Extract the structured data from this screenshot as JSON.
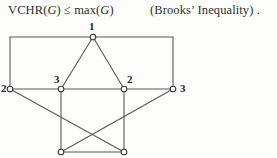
{
  "formula": {
    "lhs": "VCHR(",
    "lhs_var": "G",
    "lhs_close": ")",
    "relation": "≤",
    "rhs": "max(",
    "rhs_var": "G",
    "rhs_close": ")",
    "full_text": "VCHR(G) ≤ max(G)",
    "note": "(Brooks’ Inequality) ."
  },
  "graph": {
    "caption": "graph-with-vertex-colouring",
    "stroke_color": "#595959",
    "vertex_fill": "#ffffff",
    "vertex_stroke": "#3a3a3a",
    "vertices": [
      {
        "id": "v-top",
        "x": 93,
        "y": 19,
        "label": "1",
        "label_x": 89,
        "label_y": 3
      },
      {
        "id": "v-left",
        "x": 10,
        "y": 71,
        "label": "2",
        "label_x": 1,
        "label_y": 65
      },
      {
        "id": "v-mid-left",
        "x": 61,
        "y": 71,
        "label": "3",
        "label_x": 54,
        "label_y": 56
      },
      {
        "id": "v-mid-right",
        "x": 124,
        "y": 71,
        "label": "2",
        "label_x": 127,
        "label_y": 56
      },
      {
        "id": "v-right",
        "x": 173,
        "y": 71,
        "label": "3",
        "label_x": 180,
        "label_y": 65
      },
      {
        "id": "v-bottom-left",
        "x": 61,
        "y": 134,
        "label": "",
        "label_x": 0,
        "label_y": 0
      },
      {
        "id": "v-bottom-right",
        "x": 124,
        "y": 134,
        "label": "",
        "label_x": 0,
        "label_y": 0
      }
    ],
    "corners": [
      {
        "id": "c-top-left",
        "x": 10,
        "y": 19
      },
      {
        "id": "c-top-right",
        "x": 173,
        "y": 19
      }
    ],
    "edges": [
      {
        "from": "v-left",
        "to": "c-top-left",
        "x1": 10,
        "y1": 71,
        "x2": 10,
        "y2": 19
      },
      {
        "from": "c-top-left",
        "to": "v-top",
        "x1": 10,
        "y1": 19,
        "x2": 93,
        "y2": 19
      },
      {
        "from": "v-top",
        "to": "c-top-right",
        "x1": 93,
        "y1": 19,
        "x2": 173,
        "y2": 19
      },
      {
        "from": "c-top-right",
        "to": "v-right",
        "x1": 173,
        "y1": 19,
        "x2": 173,
        "y2": 71
      },
      {
        "from": "v-top",
        "to": "v-mid-left",
        "x1": 93,
        "y1": 19,
        "x2": 61,
        "y2": 71
      },
      {
        "from": "v-top",
        "to": "v-mid-right",
        "x1": 93,
        "y1": 19,
        "x2": 124,
        "y2": 71
      },
      {
        "from": "v-left",
        "to": "v-mid-left",
        "x1": 10,
        "y1": 71,
        "x2": 61,
        "y2": 71
      },
      {
        "from": "v-mid-left",
        "to": "v-mid-right",
        "x1": 61,
        "y1": 71,
        "x2": 124,
        "y2": 71
      },
      {
        "from": "v-mid-right",
        "to": "v-right",
        "x1": 124,
        "y1": 71,
        "x2": 173,
        "y2": 71
      },
      {
        "from": "v-mid-left",
        "to": "v-bottom-left",
        "x1": 61,
        "y1": 71,
        "x2": 61,
        "y2": 134
      },
      {
        "from": "v-mid-right",
        "to": "v-bottom-right",
        "x1": 124,
        "y1": 71,
        "x2": 124,
        "y2": 134
      },
      {
        "from": "v-left",
        "to": "v-bottom-right",
        "x1": 10,
        "y1": 71,
        "x2": 124,
        "y2": 134
      },
      {
        "from": "v-right",
        "to": "v-bottom-left",
        "x1": 173,
        "y1": 71,
        "x2": 61,
        "y2": 134
      },
      {
        "from": "v-bottom-left",
        "to": "v-bottom-right",
        "x1": 61,
        "y1": 134,
        "x2": 124,
        "y2": 134
      }
    ]
  }
}
